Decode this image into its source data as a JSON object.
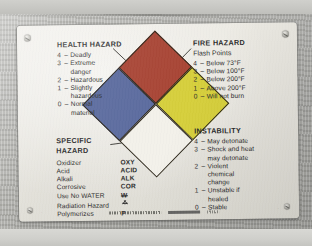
{
  "placard": {
    "type": "NFPA 704 hazard identification placard",
    "background_color": "#e9e7e0",
    "wall_color": "#b4b4b0"
  },
  "diamond": {
    "health_color": "#5a6a9e",
    "fire_color": "#a84434",
    "instability_color": "#d6cf3c",
    "specific_color": "#f3f1ea",
    "border_color": "#2a2418"
  },
  "health": {
    "heading": "HEALTH HAZARD",
    "rows": [
      {
        "num": "4",
        "dash": "–",
        "text": "Deadly",
        "cont": ""
      },
      {
        "num": "3",
        "dash": "–",
        "text": "Extreme",
        "cont": "danger"
      },
      {
        "num": "2",
        "dash": "–",
        "text": "Hazardous",
        "cont": ""
      },
      {
        "num": "1",
        "dash": "–",
        "text": "Slightly",
        "cont": "hazardous"
      },
      {
        "num": "0",
        "dash": "–",
        "text": "Normal",
        "cont": "material"
      }
    ]
  },
  "fire": {
    "heading": "FIRE HAZARD",
    "subheading": "Flash Points",
    "rows": [
      {
        "num": "4",
        "dash": "–",
        "text": "Below 73°F"
      },
      {
        "num": "3",
        "dash": "–",
        "text": "Below 100°F"
      },
      {
        "num": "2",
        "dash": "–",
        "text": "Below 200°F"
      },
      {
        "num": "1",
        "dash": "–",
        "text": "Above 200°F"
      },
      {
        "num": "0",
        "dash": "–",
        "text": "Will not burn"
      }
    ]
  },
  "instability": {
    "heading": "INSTABILITY",
    "rows": [
      {
        "num": "4",
        "dash": "–",
        "text": "May detonate",
        "cont": ""
      },
      {
        "num": "3",
        "dash": "–",
        "text": "Shock and heat",
        "cont": "may detonate"
      },
      {
        "num": "2",
        "dash": "–",
        "text": "Violent",
        "cont": "chemical",
        "cont2": "change"
      },
      {
        "num": "1",
        "dash": "–",
        "text": "Unstable if",
        "cont": "healed"
      },
      {
        "num": "0",
        "dash": "–",
        "text": "Stable",
        "cont": ""
      }
    ]
  },
  "specific": {
    "heading_line1": "SPECIFIC",
    "heading_line2": "HAZARD",
    "rows": [
      {
        "name": "Oxidizer",
        "abbr": "OXY",
        "symbol": "text"
      },
      {
        "name": "Acid",
        "abbr": "ACID",
        "symbol": "text"
      },
      {
        "name": "Alkali",
        "abbr": "ALK",
        "symbol": "text"
      },
      {
        "name": "Corrosive",
        "abbr": "COR",
        "symbol": "text"
      },
      {
        "name": "Use No WATER",
        "abbr": "W",
        "symbol": "w-struck"
      },
      {
        "name": "Radiation Hazard",
        "abbr": "",
        "symbol": "radiation-trefoil"
      },
      {
        "name": "Polymerizes",
        "abbr": "P",
        "symbol": "text"
      }
    ]
  },
  "fineprint": {
    "note": "illegible manufacturer fine print and barcode along bottom edge"
  }
}
